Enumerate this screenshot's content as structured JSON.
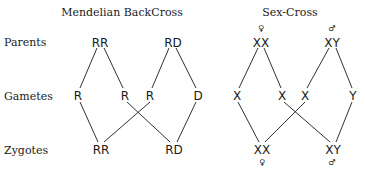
{
  "titles": {
    "left": "Mendelian BackCross",
    "right": "Sex-Cross"
  },
  "row_labels": {
    "parents": "Parents",
    "gametes": "Gametes",
    "zygotes": "Zygotes"
  },
  "mendelian": {
    "parents": [
      "RR",
      "RD"
    ],
    "gametes": [
      "R",
      "R",
      "R",
      "D"
    ],
    "zygotes": [
      "RR",
      "RD"
    ]
  },
  "sex_cross": {
    "parents": [
      "XX",
      "XY"
    ],
    "parent_symbols": [
      "♀",
      "♂"
    ],
    "gametes": [
      "X",
      "X",
      "X",
      "Y"
    ],
    "zygotes": [
      "XX",
      "XY"
    ],
    "zygote_symbols": [
      "♀",
      "♂"
    ]
  }
}
